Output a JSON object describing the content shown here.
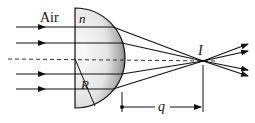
{
  "diagram": {
    "labels": {
      "medium": "Air",
      "index": "n",
      "radius": "R",
      "image": "I",
      "distance": "q"
    },
    "colors": {
      "ink": "#111111",
      "background": "#ffffff",
      "glass_light": "#f2f2f2",
      "glass_dark": "#6a6a6a"
    }
  }
}
